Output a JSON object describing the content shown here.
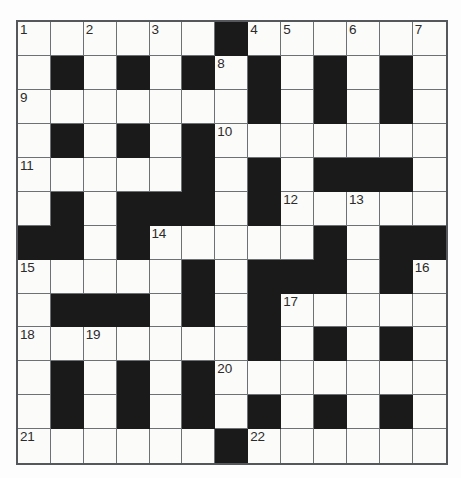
{
  "puzzle": {
    "type": "crossword-grid",
    "title": "",
    "size": {
      "columns": 13,
      "rows": 13
    },
    "colors": {
      "page_background": "#ffffff",
      "grid_background": "#fdfdfd",
      "light_cell": "#fbfbfa",
      "block_cell": "#1a1a1a",
      "grid_line": "#6d7173",
      "grid_border": "#54585a",
      "number_text": "#2b2b2b"
    },
    "legend": {
      "block_symbol": "#",
      "light_symbol": "."
    },
    "grid_rows": [
      "......#......",
      ".#.#.#.#.#.#.",
      ".......#.#.#.",
      ".#.#.#.......",
      ".....#.#.###.",
      ".#.###.#.....",
      "##.#.....#.##",
      ".....#.###.#.",
      ".###.#.#.....",
      ".......#.#.#.",
      ".#.#.#.......",
      ".#.#.#.#.#.#.",
      "......#......"
    ],
    "numbers": [
      {
        "clue": 1,
        "row": 0,
        "col": 0
      },
      {
        "clue": 2,
        "row": 0,
        "col": 2
      },
      {
        "clue": 3,
        "row": 0,
        "col": 4
      },
      {
        "clue": 4,
        "row": 0,
        "col": 7
      },
      {
        "clue": 5,
        "row": 0,
        "col": 8
      },
      {
        "clue": 6,
        "row": 0,
        "col": 10
      },
      {
        "clue": 7,
        "row": 0,
        "col": 12
      },
      {
        "clue": 8,
        "row": 1,
        "col": 6
      },
      {
        "clue": 9,
        "row": 2,
        "col": 0
      },
      {
        "clue": 10,
        "row": 3,
        "col": 6
      },
      {
        "clue": 11,
        "row": 4,
        "col": 0
      },
      {
        "clue": 12,
        "row": 5,
        "col": 8
      },
      {
        "clue": 13,
        "row": 5,
        "col": 10
      },
      {
        "clue": 14,
        "row": 6,
        "col": 4
      },
      {
        "clue": 15,
        "row": 7,
        "col": 0
      },
      {
        "clue": 16,
        "row": 7,
        "col": 12
      },
      {
        "clue": 17,
        "row": 8,
        "col": 8
      },
      {
        "clue": 18,
        "row": 9,
        "col": 0
      },
      {
        "clue": 19,
        "row": 9,
        "col": 2
      },
      {
        "clue": 20,
        "row": 10,
        "col": 6
      },
      {
        "clue": 21,
        "row": 12,
        "col": 0
      },
      {
        "clue": 22,
        "row": 12,
        "col": 7
      }
    ],
    "entries": []
  }
}
